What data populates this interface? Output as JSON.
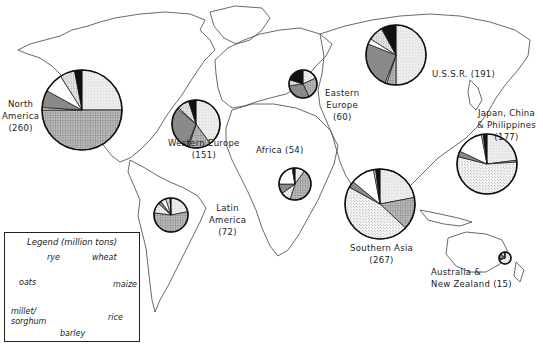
{
  "legend": {
    "title": "Legend (million tons)",
    "crops": [
      {
        "key": "wheat",
        "label": "wheat",
        "pattern": "light-dotted"
      },
      {
        "key": "maize",
        "label": "maize",
        "pattern": "cross-hatched"
      },
      {
        "key": "rice",
        "label": "rice",
        "pattern": "stippled"
      },
      {
        "key": "barley",
        "label": "barley",
        "pattern": "dark-gray"
      },
      {
        "key": "millet",
        "label": "millet/ sorghum",
        "pattern": "white"
      },
      {
        "key": "oats",
        "label": "oats",
        "pattern": "light-dotted-dense"
      },
      {
        "key": "rye",
        "label": "rye",
        "pattern": "black"
      }
    ]
  },
  "chart_data": {
    "type": "pie",
    "units": "million tons",
    "categories": [
      "wheat",
      "maize",
      "rice",
      "barley",
      "millet/sorghum",
      "oats",
      "rye"
    ],
    "regions": [
      {
        "name": "North America",
        "total": 260,
        "label": "North America (260)",
        "shares": {
          "wheat": 25,
          "maize": 50,
          "rice": 1,
          "barley": 7,
          "millet/sorghum": 8,
          "oats": 6,
          "rye": 3
        }
      },
      {
        "name": "Western Europe",
        "total": 151,
        "label": "Western Europe (151)",
        "shares": {
          "wheat": 40,
          "maize": 15,
          "rice": 1,
          "barley": 30,
          "millet/sorghum": 1,
          "oats": 8,
          "rye": 5
        }
      },
      {
        "name": "Eastern Europe",
        "total": 60,
        "label": "Eastern Europe (60)",
        "shares": {
          "wheat": 18,
          "maize": 25,
          "rice": 0,
          "barley": 30,
          "millet/sorghum": 0,
          "oats": 7,
          "rye": 20
        }
      },
      {
        "name": "U.S.S.R.",
        "total": 191,
        "label": "U.S.S.R. (191)",
        "shares": {
          "wheat": 50,
          "maize": 5,
          "rice": 1,
          "barley": 25,
          "millet/sorghum": 3,
          "oats": 8,
          "rye": 8
        }
      },
      {
        "name": "Japan, China & Philippines",
        "total": 177,
        "label": "Japan, China & Philippines (177)",
        "shares": {
          "wheat": 23,
          "maize": 1,
          "rice": 55,
          "barley": 3,
          "millet/sorghum": 15,
          "oats": 1,
          "rye": 2
        }
      },
      {
        "name": "Africa",
        "total": 54,
        "label": "Africa (54)",
        "shares": {
          "wheat": 10,
          "maize": 45,
          "rice": 10,
          "barley": 10,
          "millet/sorghum": 22,
          "oats": 1,
          "rye": 2
        }
      },
      {
        "name": "Southern Asia",
        "total": 267,
        "label": "Southern Asia (267)",
        "shares": {
          "wheat": 22,
          "maize": 15,
          "rice": 46,
          "barley": 3,
          "millet/sorghum": 11,
          "oats": 1,
          "rye": 2
        }
      },
      {
        "name": "Latin America",
        "total": 72,
        "label": "Latin America (72)",
        "shares": {
          "wheat": 22,
          "maize": 55,
          "rice": 10,
          "barley": 3,
          "millet/sorghum": 5,
          "oats": 4,
          "rye": 1
        }
      },
      {
        "name": "Australia & New Zealand",
        "total": 15,
        "label": "Australia & New Zealand (15)",
        "shares": {
          "wheat": 70,
          "maize": 2,
          "rice": 1,
          "barley": 14,
          "millet/sorghum": 1,
          "oats": 11,
          "rye": 1
        }
      }
    ]
  },
  "labels": {
    "north_america": [
      "North",
      "America",
      "(260)"
    ],
    "western_europe": [
      "Western Europe",
      "(151)"
    ],
    "eastern_europe": [
      "Eastern",
      "Europe",
      "(60)"
    ],
    "ussr": "U.S.S.R. (191)",
    "japan_china": [
      "Japan, China",
      "& Philippines",
      "(177)"
    ],
    "africa": "Africa (54)",
    "southern_asia": [
      "Southern Asia",
      "(267)"
    ],
    "latin_america": [
      "Latin",
      "America",
      "(72)"
    ],
    "australia": [
      "Australia &",
      "New Zealand (15)"
    ]
  }
}
